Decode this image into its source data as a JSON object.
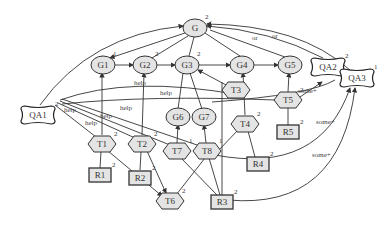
{
  "diagram": {
    "type": "goal-model",
    "goals": [
      {
        "id": "G",
        "label": "G",
        "x": 195,
        "y": 28,
        "num": "2"
      },
      {
        "id": "G1",
        "label": "G1",
        "x": 103,
        "y": 65,
        "num": "1"
      },
      {
        "id": "G2",
        "label": "G2",
        "x": 145,
        "y": 65,
        "num": "2"
      },
      {
        "id": "G3",
        "label": "G3",
        "x": 187,
        "y": 65,
        "num": "2"
      },
      {
        "id": "G4",
        "label": "G4",
        "x": 242,
        "y": 65,
        "num": ""
      },
      {
        "id": "G5",
        "label": "G5",
        "x": 290,
        "y": 65,
        "num": ""
      },
      {
        "id": "G6",
        "label": "G6",
        "x": 178,
        "y": 117,
        "num": ""
      },
      {
        "id": "G7",
        "label": "G7",
        "x": 204,
        "y": 117,
        "num": ""
      }
    ],
    "tasks": [
      {
        "id": "T1",
        "label": "T1",
        "x": 102,
        "y": 144,
        "num": "2"
      },
      {
        "id": "T2",
        "label": "T2",
        "x": 142,
        "y": 144,
        "num": "2"
      },
      {
        "id": "T3",
        "label": "T3",
        "x": 236,
        "y": 90,
        "num": ""
      },
      {
        "id": "T4",
        "label": "T4",
        "x": 245,
        "y": 124,
        "num": "2"
      },
      {
        "id": "T5",
        "label": "T5",
        "x": 288,
        "y": 100,
        "num": "2"
      },
      {
        "id": "T6",
        "label": "T6",
        "x": 170,
        "y": 201,
        "num": "2"
      },
      {
        "id": "T7",
        "label": "T7",
        "x": 177,
        "y": 151,
        "num": "1"
      },
      {
        "id": "T8",
        "label": "T8",
        "x": 207,
        "y": 151,
        "num": "1"
      }
    ],
    "resources": [
      {
        "id": "R1",
        "label": "R1",
        "x": 100,
        "y": 175,
        "num": "2"
      },
      {
        "id": "R2",
        "label": "R2",
        "x": 140,
        "y": 178,
        "num": "2"
      },
      {
        "id": "R3",
        "label": "R3",
        "x": 222,
        "y": 202,
        "num": "2"
      },
      {
        "id": "R4",
        "label": "R4",
        "x": 258,
        "y": 164,
        "num": "2"
      },
      {
        "id": "R5",
        "label": "R5",
        "x": 288,
        "y": 132,
        "num": "2"
      }
    ],
    "qualities": [
      {
        "id": "QA1",
        "label": "QA1",
        "x": 38,
        "y": 115,
        "num": "2"
      },
      {
        "id": "QA2",
        "label": "QA2",
        "x": 328,
        "y": 67,
        "num": "2"
      },
      {
        "id": "QA3",
        "label": "QA3",
        "x": 357,
        "y": 78,
        "num": "1"
      }
    ],
    "edge_labels": {
      "help": "help",
      "or": "or",
      "some_plus": "some+"
    }
  }
}
